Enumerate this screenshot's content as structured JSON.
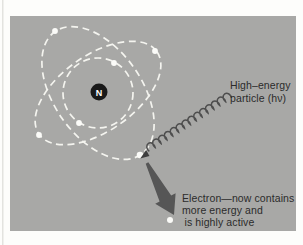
{
  "figure": {
    "nucleus_label": "N",
    "high_energy_label": {
      "line1": "High–energy",
      "line2": "particle (hν)"
    },
    "electron_label": {
      "line1": "Electron—now contains",
      "line2": "more energy and",
      "line3": "is highly active"
    }
  },
  "colors": {
    "panel_bg": "#a8a8a6",
    "page_edge": "#e3e3df",
    "orbit": "#f4f4ef",
    "electron": "#fbfbf8",
    "nucleus": "#191919",
    "coil": "#4e4e4e",
    "coil_arrowhead": "#3e3e3e",
    "big_arrow": "#565656",
    "text": "#2b2b2b"
  }
}
